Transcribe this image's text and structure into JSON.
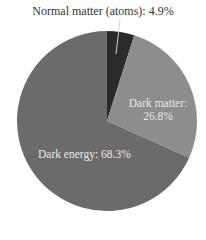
{
  "chart_data": {
    "type": "pie",
    "title": "",
    "slices": [
      {
        "label": "Normal matter (atoms)",
        "value": 4.9,
        "color": "#2b2b2b",
        "label_text": "Normal matter (atoms): 4.9%"
      },
      {
        "label": "Dark matter",
        "value": 26.8,
        "color": "#8d8d8d",
        "label_text": "Dark matter:",
        "value_text": "26.8%"
      },
      {
        "label": "Dark energy",
        "value": 68.3,
        "color": "#6b6b6b",
        "label_text": "Dark energy: 68.3%"
      }
    ],
    "start_angle_deg": 0,
    "direction": "clockwise",
    "legend": "none"
  }
}
